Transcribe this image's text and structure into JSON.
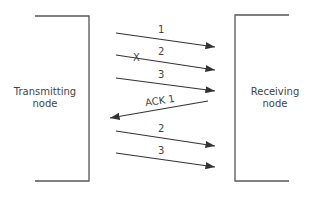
{
  "nodes": {
    "transmitting": {
      "line1": "Transmitting",
      "line2": "node"
    },
    "receiving": {
      "line1": "Receiving",
      "line2": "node"
    }
  },
  "messages": [
    {
      "label": "1",
      "direction": "right",
      "lost": false
    },
    {
      "label": "2",
      "direction": "right",
      "lost": true,
      "marker": "X"
    },
    {
      "label": "3",
      "direction": "right",
      "lost": false
    },
    {
      "label": "ACK 1",
      "direction": "left",
      "lost": false
    },
    {
      "label": "2",
      "direction": "right",
      "lost": false
    },
    {
      "label": "3",
      "direction": "right",
      "lost": false
    }
  ],
  "colors": {
    "line": "#3a3a3a",
    "text": "#444444"
  }
}
